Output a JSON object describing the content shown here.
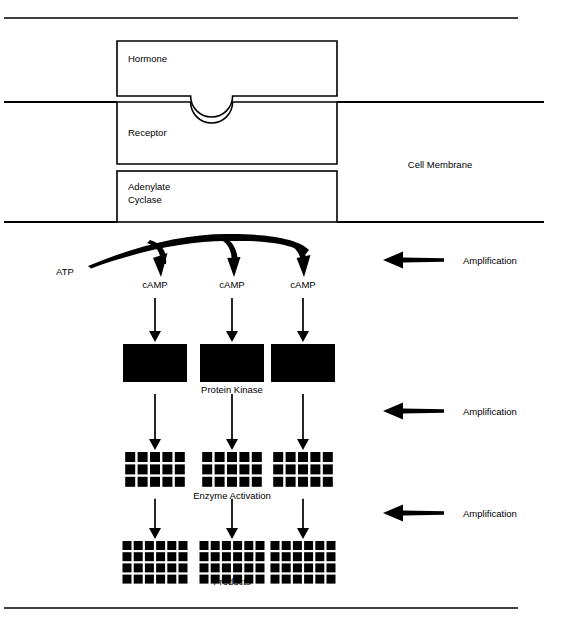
{
  "figure": {
    "title_visible": false,
    "colors": {
      "ink": "#000000",
      "paper": "#ffffff"
    }
  },
  "membrane": {
    "label": "Cell Membrane",
    "outer_line_y": 102,
    "inner_line_y": 222,
    "line_x_start": 4,
    "line_x_end": 544
  },
  "rules": {
    "top_y": 18,
    "bottom_y": 608,
    "x_start": 4,
    "x_end": 518
  },
  "proteins": {
    "hormone": {
      "label": "Hormone",
      "x": 117,
      "y": 41,
      "w": 220,
      "h": 55
    },
    "receptor": {
      "label": "Receptor",
      "x": 117,
      "y": 102,
      "w": 220,
      "h": 62
    },
    "adenylate_cyclase": {
      "label_line1": "Adenylate",
      "label_line2": "Cyclase",
      "x": 117,
      "y": 171,
      "w": 220,
      "h": 51
    }
  },
  "substrate": {
    "atp_label": "ATP"
  },
  "cascade": {
    "columns_x": [
      155,
      232,
      303
    ],
    "camp": {
      "label": "cAMP",
      "label_y": 285,
      "count": 3
    },
    "protein_kinase": {
      "label": "Protein Kinase",
      "label_x": 232,
      "label_y": 390,
      "block_w": 64,
      "block_h": 38,
      "block_y": 344,
      "count": 3
    },
    "enzyme_activation": {
      "label": "Enzyme Activation",
      "label_x": 232,
      "label_y": 496,
      "grid_cols": 5,
      "grid_rows": 3,
      "cell": 10,
      "gap": 2.4,
      "grid_y": 452,
      "count": 3
    },
    "products": {
      "label": "Products",
      "label_x": 232,
      "label_y": 582,
      "grid_cols": 6,
      "grid_rows": 4,
      "cell": 9,
      "gap": 2.2,
      "grid_y": 541,
      "count": 3
    }
  },
  "amplification": {
    "label": "Amplification",
    "arrows": [
      {
        "y": 260,
        "tip_x": 383,
        "tail_x": 444,
        "label_x": 463
      },
      {
        "y": 411,
        "tip_x": 383,
        "tail_x": 444,
        "label_x": 463
      },
      {
        "y": 513,
        "tip_x": 383,
        "tail_x": 444,
        "label_x": 463
      }
    ],
    "count": 3
  }
}
